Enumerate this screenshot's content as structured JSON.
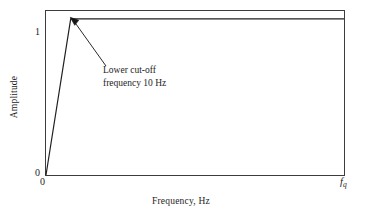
{
  "chart_data": {
    "type": "line",
    "title": "",
    "subtitle": "",
    "xlabel": "Frequency, Hz",
    "ylabel": "Amplitude",
    "grid": false,
    "legend": null,
    "xlim": [
      0,
      1
    ],
    "ylim": [
      0,
      1.05
    ],
    "x_tick_labels": [
      "0",
      "fq"
    ],
    "y_tick_labels": [
      "0",
      "1"
    ],
    "series": [
      {
        "name": "High-pass filter amplitude response",
        "x": [
          0.0,
          0.083,
          1.0
        ],
        "y": [
          0.0,
          1.0,
          1.0
        ]
      }
    ],
    "annotations": [
      {
        "text_lines": [
          "Lower cut-off",
          "frequency 10 Hz"
        ],
        "points_to_x": 0.083,
        "points_to_y": 1.0,
        "arrow": true
      }
    ]
  },
  "axes": {
    "ylabel": "Amplitude",
    "xlabel": "Frequency, Hz",
    "ticks": {
      "y_one": "1",
      "y_zero": "0",
      "x_zero": "0",
      "x_nyquist_symbol": "f",
      "x_nyquist_subscript": "q"
    }
  },
  "annotation": {
    "line1": "Lower cut-off",
    "line2": "frequency 10 Hz"
  },
  "colors": {
    "background": "#ffffff",
    "frame": "#3c3c3c",
    "curve": "#202020",
    "text": "#1d1d1d",
    "leader": "#2a2a2a"
  }
}
